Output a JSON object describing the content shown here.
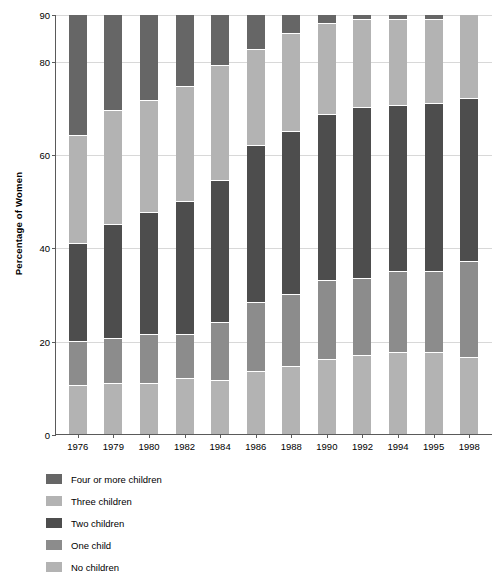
{
  "chart_data": {
    "type": "bar",
    "stacked": true,
    "title": "",
    "xlabel": "",
    "ylabel": "Percentage of Women",
    "ylim": [
      0,
      90
    ],
    "yticks": [
      0,
      20,
      40,
      60,
      80,
      90
    ],
    "grid": true,
    "legend_position": "below-left",
    "categories": [
      "1976",
      "1979",
      "1980",
      "1982",
      "1984",
      "1986",
      "1988",
      "1990",
      "1992",
      "1994",
      "1995",
      "1998"
    ],
    "series": [
      {
        "name": "No children",
        "color": "#b3b3b3",
        "values": [
          10.5,
          11.0,
          11.0,
          12.0,
          11.5,
          13.5,
          14.5,
          16.0,
          17.0,
          17.5,
          17.5,
          16.5
        ]
      },
      {
        "name": "One child",
        "color": "#8c8c8c",
        "values": [
          9.5,
          9.5,
          10.5,
          9.5,
          12.5,
          14.8,
          15.5,
          17.0,
          16.5,
          17.5,
          17.5,
          20.5
        ]
      },
      {
        "name": "Two children",
        "color": "#4d4d4d",
        "values": [
          21.0,
          24.5,
          26.0,
          28.5,
          30.5,
          33.7,
          35.0,
          35.5,
          36.5,
          35.5,
          36.0,
          35.0
        ]
      },
      {
        "name": "Three children",
        "color": "#b3b3b3",
        "values": [
          23.0,
          24.5,
          24.0,
          24.5,
          24.5,
          20.5,
          21.0,
          19.5,
          19.0,
          18.5,
          18.0,
          18.0
        ]
      },
      {
        "name": "Four or more children",
        "color": "#666666",
        "values": [
          26.0,
          20.5,
          18.5,
          15.5,
          11.0,
          7.5,
          4.0,
          2.0,
          1.0,
          1.0,
          1.0,
          0.0
        ]
      }
    ],
    "legend_order": [
      "Four or more children",
      "Three children",
      "Two children",
      "One child",
      "No children"
    ],
    "colors": {
      "four_or_more_children": "#666666",
      "three_children": "#b3b3b3",
      "two_children": "#4d4d4d",
      "one_child": "#8c8c8c",
      "no_children": "#b3b3b3",
      "gridline": "#d8d8d8",
      "axis": "#5a5a5a",
      "background": "#ffffff"
    }
  }
}
